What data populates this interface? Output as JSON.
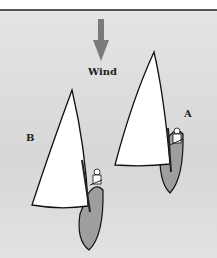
{
  "diagram": {
    "wind_label": "Wind",
    "boat_a_label": "A",
    "boat_b_label": "B",
    "colors": {
      "background": "#dcdcdc",
      "wind_arrow": "#777777",
      "sail": "#ffffff",
      "hull": "#9a9a9a",
      "outline": "#111111"
    }
  }
}
